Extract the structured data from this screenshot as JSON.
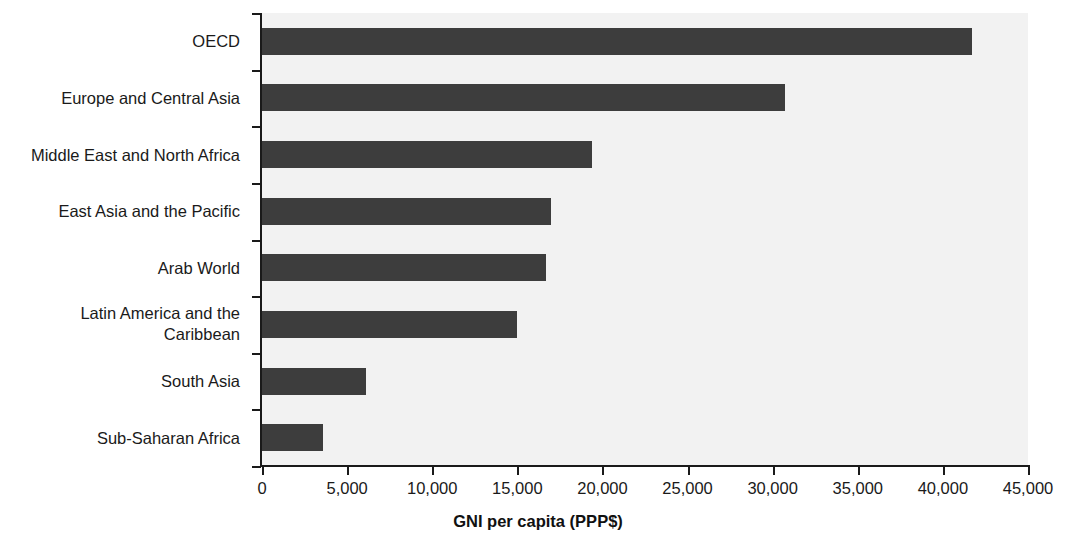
{
  "chart_data": {
    "type": "bar",
    "orientation": "horizontal",
    "title": "",
    "xlabel": "GNI per capita (PPP$)",
    "ylabel": "",
    "xlim": [
      0,
      45000
    ],
    "xticks": [
      0,
      5000,
      10000,
      15000,
      20000,
      25000,
      30000,
      35000,
      40000,
      45000
    ],
    "xtick_labels": [
      "0",
      "5,000",
      "10,000",
      "15,000",
      "20,000",
      "25,000",
      "30,000",
      "35,000",
      "40,000",
      "45,000"
    ],
    "grid": false,
    "legend": false,
    "categories": [
      "OECD",
      "Europe and Central Asia",
      "Middle East and North Africa",
      "East Asia and the Pacific",
      "Arab World",
      "Latin America and the Caribbean",
      "South Asia",
      "Sub-Saharan Africa"
    ],
    "values": [
      41700,
      30700,
      19400,
      17000,
      16700,
      15000,
      6100,
      3600
    ],
    "series": [
      {
        "name": "GNI per capita (PPP$)",
        "values": [
          41700,
          30700,
          19400,
          17000,
          16700,
          15000,
          6100,
          3600
        ]
      }
    ],
    "colors": {
      "bar": "#3d3d3d",
      "plot_background": "#f2f2f2",
      "axis": "#1a1a1a",
      "page_background": "#ffffff",
      "text": "#1a1a1a"
    }
  }
}
